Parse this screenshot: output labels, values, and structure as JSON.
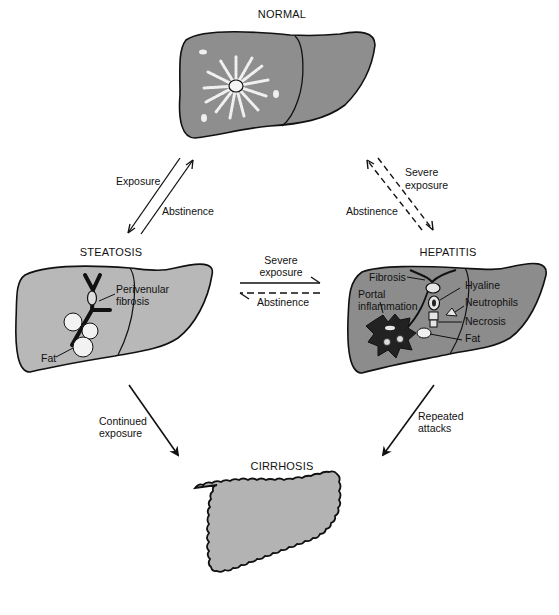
{
  "stages": {
    "normal": "NORMAL",
    "steatosis": "STEATOSIS",
    "hepatitis": "HEPATITIS",
    "cirrhosis": "CIRRHOSIS"
  },
  "transitions": {
    "normal_steatosis": {
      "forward": "Exposure",
      "back": "Abstinence"
    },
    "normal_hepatitis": {
      "forward_line1": "Severe",
      "forward_line2": "exposure",
      "back": "Abstinence"
    },
    "steatosis_hepatitis": {
      "forward_line1": "Severe",
      "forward_line2": "exposure",
      "back": "Abstinence"
    },
    "steatosis_cirrhosis": {
      "line1": "Continued",
      "line2": "exposure"
    },
    "hepatitis_cirrhosis": {
      "line1": "Repeated",
      "line2": "attacks"
    }
  },
  "steatosis_labels": {
    "perivenular_line1": "Perivenular",
    "perivenular_line2": "fibrosis",
    "fat": "Fat"
  },
  "hepatitis_labels": {
    "fibrosis": "Fibrosis",
    "portal_line1": "Portal",
    "portal_line2": "inflammation",
    "hyaline": "Hyaline",
    "neutrophils": "Neutrophils",
    "necrosis": "Necrosis",
    "fat": "Fat"
  },
  "colors": {
    "normal_fill": "#8e8e8e",
    "steatosis_fill": "#b8b8b8",
    "hepatitis_fill": "#8c8c8c",
    "cirrhosis_fill": "#b3b3b3",
    "outline": "#111111",
    "inflammation": "#222222"
  }
}
